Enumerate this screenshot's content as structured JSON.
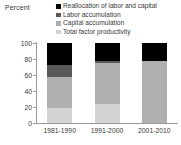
{
  "chart_data": {
    "type": "bar",
    "subtype": "stacked-vertical-100",
    "title": "",
    "ylabel": "Percent",
    "xlabel": "",
    "ylim": [
      0,
      100
    ],
    "yticks": [
      0,
      20,
      40,
      60,
      80,
      100
    ],
    "grid": false,
    "legend_position": "top-right",
    "categories": [
      "1981-1990",
      "1991-2000",
      "2001-2010"
    ],
    "series": [
      {
        "name": "Total factor productivity",
        "color": "#d4d4d4",
        "values": [
          19,
          24,
          0
        ]
      },
      {
        "name": "Capital accumulation",
        "color": "#b0b0b0",
        "values": [
          39,
          51,
          77
        ]
      },
      {
        "name": "Labor accumulation",
        "color": "#595959",
        "values": [
          15,
          3,
          0
        ]
      },
      {
        "name": "Reallocation of labor and capital",
        "color": "#000000",
        "values": [
          27,
          22,
          23
        ]
      }
    ]
  },
  "axis": {
    "y_title": "Percent",
    "y_tick_labels": [
      "100",
      "80",
      "60",
      "40",
      "20",
      "0"
    ],
    "x_tick_labels": [
      "1981-1990",
      "1991-2000",
      "2001-2010"
    ]
  },
  "legend": {
    "entries": [
      {
        "label": "Reallocation of labor and capital",
        "color": "#000000"
      },
      {
        "label": "Labor accumulation",
        "color": "#595959"
      },
      {
        "label": "Capital accumulation",
        "color": "#b0b0b0"
      },
      {
        "label": "Total factor productivity",
        "color": "#d4d4d4"
      }
    ]
  },
  "colors": {
    "background": "#ffffff",
    "text": "#3a3a3a",
    "axis": "#9a9a9a"
  }
}
